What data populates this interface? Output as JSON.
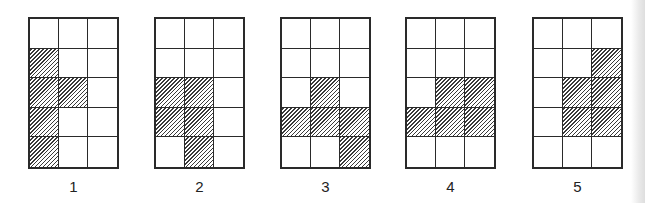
{
  "figure": {
    "type": "grid-pattern-options",
    "grid_rows": 5,
    "grid_cols": 3,
    "colors": {
      "line": "#2a2a2a",
      "hatch": "#3a3a3a",
      "background": "#ffffff"
    },
    "hatch_style": "diagonal-forward-slash",
    "options": [
      {
        "label": "1",
        "left": 28,
        "shaded_cells": [
          [
            1,
            0
          ],
          [
            2,
            0
          ],
          [
            2,
            1
          ],
          [
            3,
            0
          ],
          [
            4,
            0
          ]
        ]
      },
      {
        "label": "2",
        "left": 154,
        "shaded_cells": [
          [
            2,
            0
          ],
          [
            2,
            1
          ],
          [
            3,
            0
          ],
          [
            3,
            1
          ],
          [
            4,
            1
          ]
        ]
      },
      {
        "label": "3",
        "left": 280,
        "shaded_cells": [
          [
            2,
            1
          ],
          [
            3,
            0
          ],
          [
            3,
            1
          ],
          [
            3,
            2
          ],
          [
            4,
            2
          ]
        ]
      },
      {
        "label": "4",
        "left": 405,
        "shaded_cells": [
          [
            2,
            1
          ],
          [
            2,
            2
          ],
          [
            3,
            0
          ],
          [
            3,
            1
          ],
          [
            3,
            2
          ]
        ]
      },
      {
        "label": "5",
        "left": 532,
        "shaded_cells": [
          [
            1,
            2
          ],
          [
            2,
            1
          ],
          [
            2,
            2
          ],
          [
            3,
            1
          ],
          [
            3,
            2
          ]
        ]
      }
    ]
  }
}
